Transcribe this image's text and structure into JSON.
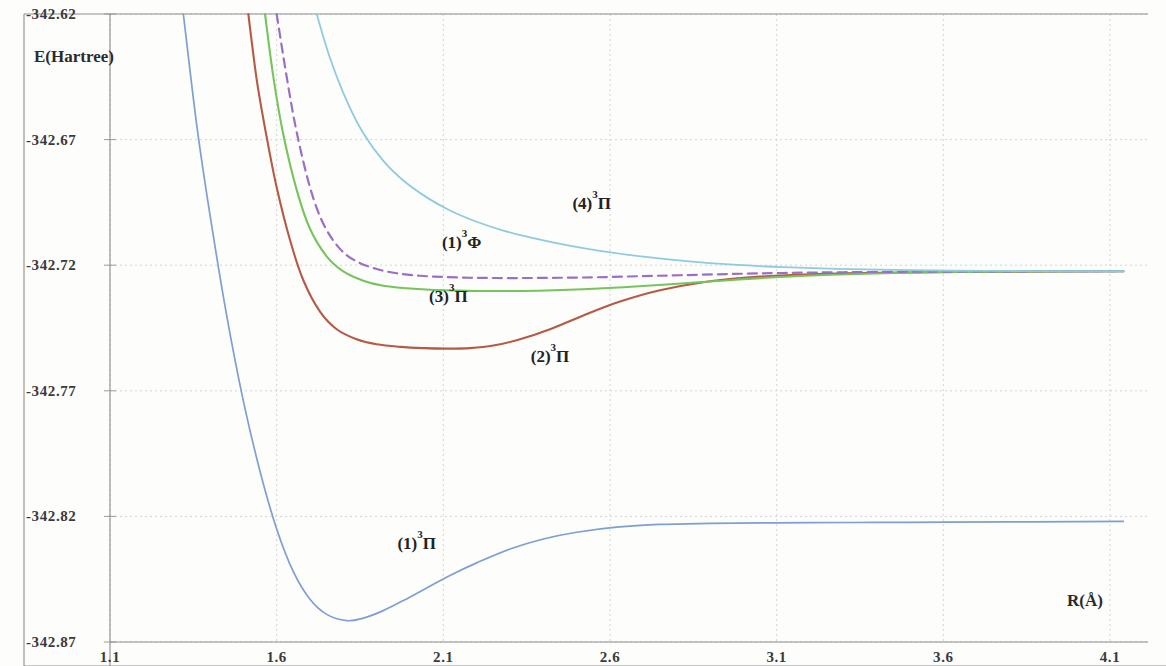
{
  "figure": {
    "background_color": "#fdfdfc",
    "frame_color": "#8d8d8d"
  },
  "axes": {
    "y_axis_title": "E(Hartree)",
    "x_axis_title": "R(Å)",
    "y_ticks": [
      "-342.62",
      "-342.67",
      "-342.72",
      "-342.77",
      "-342.82",
      "-342.87"
    ],
    "x_ticks": [
      "1.1",
      "1.6",
      "2.1",
      "2.6",
      "3.1",
      "3.6",
      "4.1"
    ]
  },
  "curve_labels": {
    "l1": "(1)³Π",
    "l2": "(2)³Π",
    "l3": "(3)³Π",
    "l4": "(4)³Π",
    "lphi": "(1)³Φ"
  },
  "chart_data": {
    "type": "line",
    "title": "",
    "xlabel": "R(Å)",
    "ylabel": "E(Hartree)",
    "xlim": [
      1.1,
      4.1
    ],
    "ylim": [
      -342.87,
      -342.62
    ],
    "xticks": [
      1.1,
      1.6,
      2.1,
      2.6,
      3.1,
      3.6,
      4.1
    ],
    "yticks": [
      -342.87,
      -342.82,
      -342.77,
      -342.72,
      -342.67,
      -342.62
    ],
    "grid": true,
    "legend_position": "inline-annotations",
    "series": [
      {
        "name": "(1)³Π",
        "color": "#7f9fd0",
        "style": "solid",
        "width": 1.7,
        "label_x": 2.02,
        "label_y": -342.833,
        "x": [
          1.32,
          1.36,
          1.4,
          1.45,
          1.5,
          1.55,
          1.6,
          1.65,
          1.7,
          1.75,
          1.81,
          1.86,
          1.92,
          1.98,
          2.05,
          2.12,
          2.2,
          2.3,
          2.4,
          2.5,
          2.62,
          2.75,
          2.9,
          3.05,
          3.2,
          3.4,
          3.6,
          3.8,
          4.0,
          4.14
        ],
        "y": [
          -342.62,
          -342.664,
          -342.7,
          -342.74,
          -342.774,
          -342.802,
          -342.825,
          -342.842,
          -342.853,
          -342.859,
          -342.8615,
          -342.8605,
          -342.8575,
          -342.8535,
          -342.8485,
          -342.8435,
          -342.8385,
          -342.833,
          -342.829,
          -342.8263,
          -342.8243,
          -342.8232,
          -342.8228,
          -342.8226,
          -342.8225,
          -342.8224,
          -342.8223,
          -342.8222,
          -342.8221,
          -342.822
        ]
      },
      {
        "name": "(2)³Π",
        "color": "#b55a46",
        "style": "solid",
        "width": 2.1,
        "label_x": 2.42,
        "label_y": -342.7585,
        "x": [
          1.515,
          1.54,
          1.57,
          1.6,
          1.64,
          1.68,
          1.73,
          1.78,
          1.84,
          1.9,
          1.97,
          2.04,
          2.11,
          2.18,
          2.25,
          2.33,
          2.42,
          2.52,
          2.63,
          2.75,
          2.88,
          3.02,
          3.18,
          3.35,
          3.55,
          3.75,
          3.95,
          4.14
        ],
        "y": [
          -342.62,
          -342.646,
          -342.669,
          -342.689,
          -342.71,
          -342.726,
          -342.7385,
          -342.7455,
          -342.7495,
          -342.7515,
          -342.7525,
          -342.753,
          -342.7532,
          -342.753,
          -342.752,
          -342.7495,
          -342.7455,
          -342.74,
          -342.7345,
          -342.73,
          -342.7268,
          -342.7248,
          -342.7237,
          -342.7231,
          -342.7228,
          -342.7226,
          -342.7225,
          -342.7224
        ]
      },
      {
        "name": "(3)³Π",
        "color": "#77c35e",
        "style": "solid",
        "width": 2.1,
        "label_x": 2.115,
        "label_y": -342.7345,
        "x": [
          1.565,
          1.59,
          1.62,
          1.66,
          1.7,
          1.75,
          1.8,
          1.86,
          1.92,
          1.99,
          2.06,
          2.14,
          2.22,
          2.31,
          2.41,
          2.52,
          2.64,
          2.77,
          2.92,
          3.08,
          3.26,
          3.45,
          3.65,
          3.85,
          4.05,
          4.14
        ],
        "y": [
          -342.62,
          -342.645,
          -342.668,
          -342.69,
          -342.7055,
          -342.7165,
          -342.7225,
          -342.7262,
          -342.7282,
          -342.7292,
          -342.7298,
          -342.7301,
          -342.7303,
          -342.7303,
          -342.7301,
          -342.7296,
          -342.7288,
          -342.7277,
          -342.7263,
          -342.7249,
          -342.7238,
          -342.7231,
          -342.7227,
          -342.7225,
          -342.7224,
          -342.7224
        ]
      },
      {
        "name": "(1)³Φ",
        "color": "#9b6fc4",
        "style": "dashed",
        "width": 2.2,
        "label_x": 2.155,
        "label_y": -342.7133,
        "x": [
          1.6,
          1.63,
          1.66,
          1.7,
          1.74,
          1.79,
          1.84,
          1.9,
          1.96,
          2.03,
          2.1,
          2.18,
          2.26,
          2.35,
          2.45,
          2.56,
          2.68,
          2.81,
          2.96,
          3.12,
          3.3,
          3.5,
          3.7,
          3.9,
          4.05,
          4.14
        ],
        "y": [
          -342.62,
          -342.645,
          -342.667,
          -342.689,
          -342.7035,
          -342.7135,
          -342.7185,
          -342.7215,
          -342.7232,
          -342.7242,
          -342.7247,
          -342.725,
          -342.7251,
          -342.7251,
          -342.725,
          -342.7248,
          -342.7244,
          -342.724,
          -342.7235,
          -342.7231,
          -342.7228,
          -342.7226,
          -342.7225,
          -342.7224,
          -342.7224,
          -342.7224
        ]
      },
      {
        "name": "(4)³Π",
        "color": "#8fcbe0",
        "style": "solid",
        "width": 1.8,
        "label_x": 2.545,
        "label_y": -342.6975,
        "x": [
          1.72,
          1.76,
          1.81,
          1.86,
          1.92,
          1.98,
          2.05,
          2.12,
          2.2,
          2.28,
          2.37,
          2.47,
          2.58,
          2.7,
          2.83,
          2.97,
          3.12,
          3.28,
          3.45,
          3.63,
          3.82,
          4.0,
          4.14
        ],
        "y": [
          -342.62,
          -342.6375,
          -342.6545,
          -342.6675,
          -342.6785,
          -342.6863,
          -342.693,
          -342.6982,
          -342.7027,
          -342.7062,
          -342.7092,
          -342.712,
          -342.7145,
          -342.7166,
          -342.7184,
          -342.7198,
          -342.7208,
          -342.7215,
          -342.7219,
          -342.7222,
          -342.7223,
          -342.7224,
          -342.7224
        ]
      }
    ]
  }
}
